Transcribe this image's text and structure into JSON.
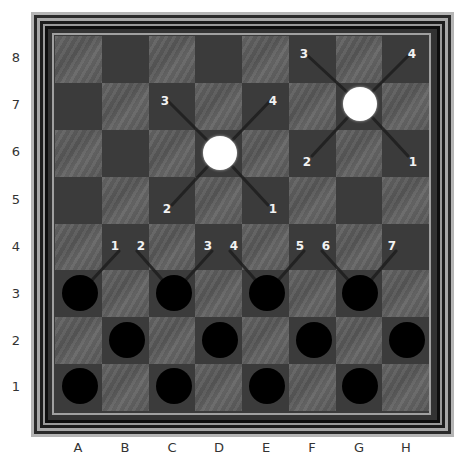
{
  "board": {
    "files": [
      "A",
      "B",
      "C",
      "D",
      "E",
      "F",
      "G",
      "H"
    ],
    "ranks": [
      "8",
      "7",
      "6",
      "5",
      "4",
      "3",
      "2",
      "1"
    ],
    "colors": {
      "light_square": "#5b5b5b",
      "dark_square": "#3b3b3b",
      "white_piece": "#ffffff",
      "black_piece": "#000000",
      "marker_text": "#f2f2f2",
      "axis_text": "#333333"
    }
  },
  "pieces": {
    "white": [
      {
        "square": "D6",
        "cx": 220,
        "cy": 153
      },
      {
        "square": "G7",
        "cx": 360,
        "cy": 104
      }
    ],
    "black": [
      {
        "square": "A3",
        "cx": 80,
        "cy": 293
      },
      {
        "square": "C3",
        "cx": 174,
        "cy": 293
      },
      {
        "square": "E3",
        "cx": 267,
        "cy": 293
      },
      {
        "square": "G3",
        "cx": 360,
        "cy": 293
      },
      {
        "square": "B2",
        "cx": 127,
        "cy": 340
      },
      {
        "square": "D2",
        "cx": 220,
        "cy": 340
      },
      {
        "square": "F2",
        "cx": 314,
        "cy": 340
      },
      {
        "square": "H2",
        "cx": 407,
        "cy": 340
      },
      {
        "square": "A1",
        "cx": 80,
        "cy": 386
      },
      {
        "square": "C1",
        "cx": 174,
        "cy": 386
      },
      {
        "square": "E1",
        "cx": 267,
        "cy": 386
      },
      {
        "square": "G1",
        "cx": 360,
        "cy": 386
      }
    ]
  },
  "move_markers": [
    {
      "label": "3",
      "x": 165,
      "y": 101
    },
    {
      "label": "4",
      "x": 273,
      "y": 101
    },
    {
      "label": "2",
      "x": 167,
      "y": 209
    },
    {
      "label": "1",
      "x": 273,
      "y": 209
    },
    {
      "label": "3",
      "x": 304,
      "y": 54
    },
    {
      "label": "4",
      "x": 412,
      "y": 54
    },
    {
      "label": "2",
      "x": 307,
      "y": 162
    },
    {
      "label": "1",
      "x": 413,
      "y": 162
    },
    {
      "label": "1",
      "x": 115,
      "y": 246
    },
    {
      "label": "2",
      "x": 141,
      "y": 246
    },
    {
      "label": "3",
      "x": 208,
      "y": 246
    },
    {
      "label": "4",
      "x": 234,
      "y": 246
    },
    {
      "label": "5",
      "x": 300,
      "y": 246
    },
    {
      "label": "6",
      "x": 326,
      "y": 246
    },
    {
      "label": "7",
      "x": 392,
      "y": 246
    }
  ],
  "move_lines": [
    {
      "from": [
        220,
        153
      ],
      "to": [
        168,
        101
      ]
    },
    {
      "from": [
        220,
        153
      ],
      "to": [
        270,
        101
      ]
    },
    {
      "from": [
        220,
        153
      ],
      "to": [
        172,
        205
      ]
    },
    {
      "from": [
        220,
        153
      ],
      "to": [
        268,
        205
      ]
    },
    {
      "from": [
        360,
        104
      ],
      "to": [
        308,
        56
      ]
    },
    {
      "from": [
        360,
        104
      ],
      "to": [
        408,
        56
      ]
    },
    {
      "from": [
        360,
        104
      ],
      "to": [
        312,
        156
      ]
    },
    {
      "from": [
        360,
        104
      ],
      "to": [
        408,
        156
      ]
    },
    {
      "from": [
        80,
        293
      ],
      "to": [
        119,
        251
      ]
    },
    {
      "from": [
        174,
        293
      ],
      "to": [
        137,
        251
      ]
    },
    {
      "from": [
        174,
        293
      ],
      "to": [
        212,
        251
      ]
    },
    {
      "from": [
        267,
        293
      ],
      "to": [
        230,
        251
      ]
    },
    {
      "from": [
        267,
        293
      ],
      "to": [
        304,
        251
      ]
    },
    {
      "from": [
        360,
        293
      ],
      "to": [
        322,
        251
      ]
    },
    {
      "from": [
        360,
        293
      ],
      "to": [
        396,
        251
      ]
    }
  ],
  "file_labels": [
    {
      "label": "A",
      "x": 78
    },
    {
      "label": "B",
      "x": 125
    },
    {
      "label": "C",
      "x": 172
    },
    {
      "label": "D",
      "x": 219
    },
    {
      "label": "E",
      "x": 266
    },
    {
      "label": "F",
      "x": 312
    },
    {
      "label": "G",
      "x": 359
    },
    {
      "label": "H",
      "x": 406
    }
  ],
  "rank_labels": [
    {
      "label": "8",
      "y": 57
    },
    {
      "label": "7",
      "y": 104
    },
    {
      "label": "6",
      "y": 151
    },
    {
      "label": "5",
      "y": 199
    },
    {
      "label": "4",
      "y": 246
    },
    {
      "label": "3",
      "y": 293
    },
    {
      "label": "2",
      "y": 340
    },
    {
      "label": "1",
      "y": 386
    }
  ]
}
